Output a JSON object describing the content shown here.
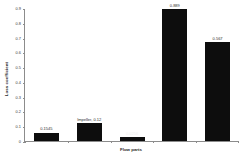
{
  "chart_data": {
    "type": "bar",
    "title": "",
    "xlabel": "Flow parts",
    "ylabel": "Loss coefficient",
    "categories": [
      "",
      "",
      "",
      "",
      ""
    ],
    "values": [
      0.0545,
      0.12,
      0.025,
      0.89,
      0.67
    ],
    "data_labels": [
      "0.1545",
      "Impeller, 0.12",
      "0.0256",
      "0.889",
      "0.567"
    ],
    "ylim": [
      0,
      0.9
    ],
    "ytick_values": [
      0,
      0.1,
      0.2,
      0.3,
      0.4,
      0.5,
      0.6,
      0.7,
      0.8,
      0.9
    ],
    "ytick_labels": [
      "0",
      "0.1",
      "0.2",
      "0.3",
      "0.4",
      "0.5",
      "0.6",
      "0.7",
      "0.8",
      "0.9"
    ],
    "grid": false,
    "legend": false,
    "bar_color": "#0d0d0d",
    "axis_color": "#8c8c8c",
    "background": "#ffffff"
  }
}
